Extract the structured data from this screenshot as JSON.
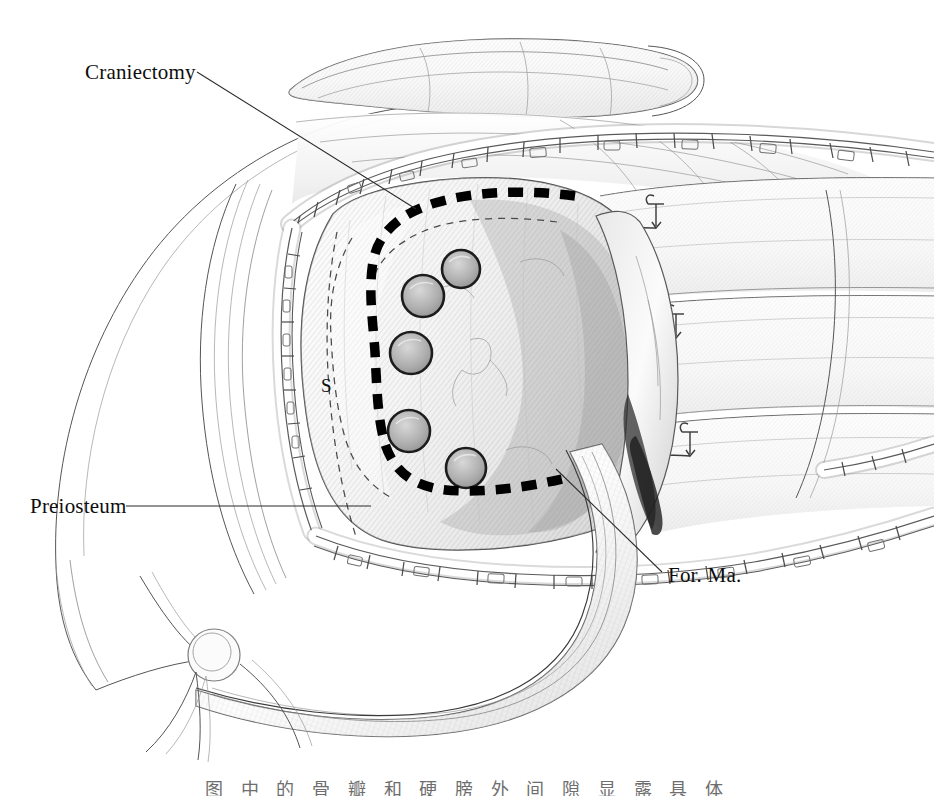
{
  "figure": {
    "kind": "anatomical-line-drawing",
    "technique": "graphite pencil illustration",
    "width": 934,
    "height": 796,
    "background_color": "#ffffff",
    "ink_color": "#0d0d0d"
  },
  "labels": [
    {
      "id": "craniectomy",
      "text": "Craniectomy",
      "text_x": 85,
      "text_y": 79,
      "anchor": "start",
      "leader": "M 197 72 L 416 209",
      "size": "label-main"
    },
    {
      "id": "preiosteum",
      "text": "Preiosteum",
      "text_x": 30,
      "text_y": 513,
      "anchor": "start",
      "leader": "M 126 506 L 371 506",
      "size": "label-main"
    },
    {
      "id": "foramen-magnum",
      "text": "For.  Ma.",
      "text_x": 668,
      "text_y": 582,
      "anchor": "start",
      "leader": "M 556 469 L 662 572",
      "size": "label-main"
    },
    {
      "id": "sigmoid-sinus",
      "text": "S",
      "text_x": 321,
      "text_y": 392,
      "anchor": "start",
      "leader": "",
      "size": "label-small"
    }
  ],
  "burr_holes": [
    {
      "cx": 461,
      "cy": 269,
      "r": 19
    },
    {
      "cx": 423,
      "cy": 296,
      "r": 21
    },
    {
      "cx": 411,
      "cy": 353,
      "r": 21
    },
    {
      "cx": 409,
      "cy": 431,
      "r": 21
    },
    {
      "cx": 466,
      "cy": 468,
      "r": 20
    }
  ],
  "craniectomy_outline": {
    "description": "bold dashed C-shaped osteotomy line",
    "path": "M 571 196 C 520 190 470 192 435 203 C 399 214 378 233 373 262 C 368 291 373 322 375 352 C 377 393 378 421 385 444 C 393 469 410 484 439 489 C 470 494 520 489 560 479",
    "stroke_width": 9.5,
    "color": "#000000"
  },
  "inner_dashed_outline": {
    "description": "thin dashed inner margin of bone flap",
    "path": "M 557 222 C 505 215 455 218 424 231 C 395 243 379 260 373 281 M 352 240 C 334 268 330 300 332 334 C 334 372 336 402 344 432 C 352 462 368 483 392 496"
  },
  "dura_dashed": {
    "description": "thin dashed vertical line descending past sigmoid sinus",
    "path": "M 336 233 C 326 282 324 336 328 388 C 332 440 340 490 356 540"
  },
  "retractor_clip_bands": [
    {
      "id": "upper-scalp-edge",
      "path": "M 290 224 C 330 190 390 166 460 152 C 545 135 640 131 730 134 C 800 136 866 142 934 152",
      "clip_count": 17,
      "width": 19
    },
    {
      "id": "left-scalp-edge",
      "path": "M 292 228 C 282 276 281 330 285 385 C 289 440 298 487 313 530",
      "clip_count": 9,
      "width": 18
    },
    {
      "id": "lower-scalp-edge",
      "path": "M 318 536 C 372 556 440 568 520 572 C 600 576 680 572 752 560 C 820 549 880 534 934 516",
      "clip_count": 16,
      "width": 18
    },
    {
      "id": "right-scalp-edge",
      "path": "M 826 468 C 866 462 900 454 934 442",
      "clip_count": 4,
      "width": 17
    }
  ],
  "suture_hooks": [
    {
      "x": 655,
      "y": 205,
      "size": 17
    },
    {
      "x": 676,
      "y": 315,
      "size": 17
    },
    {
      "x": 690,
      "y": 432,
      "size": 17
    }
  ],
  "muscle_flap_bands": [
    {
      "id": "band-1",
      "y_left": 196,
      "y_right": 186
    },
    {
      "id": "band-2",
      "y_left": 307,
      "y_right": 296
    },
    {
      "id": "band-3",
      "y_left": 424,
      "y_right": 412
    }
  ],
  "caption": {
    "text": "图 中 的 骨 瓣 和 硬 膀 外 间 隙 显 露 具 体",
    "clipped": true,
    "note": "caption is cropped by the bottom edge of the image; only the tops of the glyphs are visible"
  }
}
